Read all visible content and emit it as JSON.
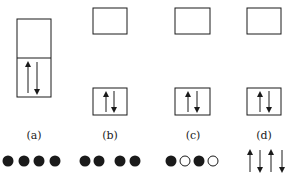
{
  "figure": {
    "panels": [
      {
        "label": "(a)",
        "description": "single tall box split in two, lower half contains up and down arrows",
        "bottom_row": [
          "filled",
          "filled",
          "filled",
          "filled"
        ]
      },
      {
        "label": "(b)",
        "description": "separated upper empty box and lower box with up and down arrows",
        "bottom_row": [
          "filled",
          "filled",
          "gap",
          "filled",
          "filled"
        ]
      },
      {
        "label": "(c)",
        "description": "separated upper empty box and lower box with up and down arrows",
        "bottom_row": [
          "filled",
          "open",
          "filled",
          "open"
        ]
      },
      {
        "label": "(d)",
        "description": "separated upper empty box and lower box with up and down arrows",
        "bottom_row": [
          "up-arrow",
          "down-arrow",
          "up-arrow",
          "down-arrow"
        ]
      }
    ]
  },
  "colors": {
    "ink": "#1a1a1a",
    "background": "#ffffff"
  }
}
